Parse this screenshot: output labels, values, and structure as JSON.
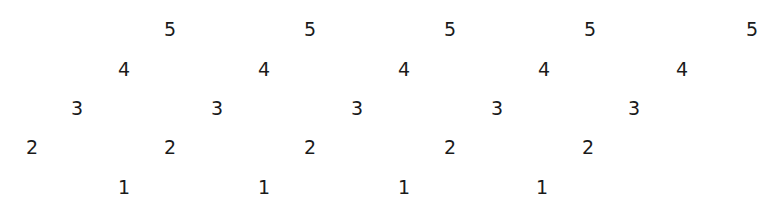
{
  "pattern": {
    "rows": [
      {
        "value": "5",
        "y": 29,
        "xs": [
          170,
          310,
          450,
          590,
          752
        ]
      },
      {
        "value": "4",
        "y": 69,
        "xs": [
          124,
          264,
          404,
          544,
          682
        ]
      },
      {
        "value": "3",
        "y": 108,
        "xs": [
          77,
          217,
          357,
          497,
          634
        ]
      },
      {
        "value": "2",
        "y": 147,
        "xs": [
          32,
          170,
          310,
          450,
          588
        ]
      },
      {
        "value": "1",
        "y": 187,
        "xs": [
          124,
          264,
          404,
          542
        ]
      }
    ]
  }
}
